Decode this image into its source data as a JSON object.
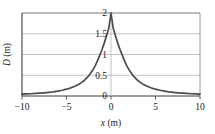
{
  "figure": {
    "name": "wave-pulse-plot"
  },
  "chart_data": {
    "type": "line",
    "title": "",
    "subtitle": "",
    "xlabel": "x (m)",
    "xlabel_symbol": "x",
    "xlabel_unit": "(m)",
    "ylabel": "D (m)",
    "ylabel_symbol": "D",
    "ylabel_unit": "(m)",
    "xlim": [
      -10,
      10
    ],
    "ylim": [
      0,
      2
    ],
    "xticks": [
      -10,
      -5,
      0,
      5,
      10
    ],
    "xticklabels": [
      "-10",
      "-5",
      "0",
      "5",
      "10"
    ],
    "yticks": [
      0,
      0.5,
      1,
      1.5,
      2
    ],
    "yticklabels": [
      "0",
      "0.5",
      "1",
      "1.5",
      "2"
    ],
    "grid": "horizontal",
    "legend": "none",
    "series": [
      {
        "name": "D(x)",
        "color": "#4c4c4c",
        "description": "Symmetric pulse peaking at 2 m at x = 0, falling toward 0 at the edges",
        "x": [
          -10,
          -9.5,
          -9,
          -8.5,
          -8,
          -7.5,
          -7,
          -6.5,
          -6,
          -5.5,
          -5,
          -4.5,
          -4,
          -3.5,
          -3,
          -2.5,
          -2,
          -1.75,
          -1.5,
          -1.25,
          -1,
          -0.75,
          -0.5,
          -0.25,
          0,
          0.25,
          0.5,
          0.75,
          1,
          1.25,
          1.5,
          1.75,
          2,
          2.5,
          3,
          3.5,
          4,
          4.5,
          5,
          5.5,
          6,
          6.5,
          7,
          7.5,
          8,
          8.5,
          9,
          9.5,
          10
        ],
        "y": [
          0.044,
          0.049,
          0.054,
          0.061,
          0.068,
          0.077,
          0.088,
          0.101,
          0.118,
          0.138,
          0.164,
          0.197,
          0.24,
          0.298,
          0.375,
          0.486,
          0.64,
          0.74,
          0.857,
          0.99,
          1.125,
          1.28,
          1.45,
          1.63,
          2.0,
          1.63,
          1.45,
          1.28,
          1.125,
          0.99,
          0.857,
          0.74,
          0.64,
          0.486,
          0.375,
          0.298,
          0.24,
          0.197,
          0.164,
          0.138,
          0.118,
          0.101,
          0.088,
          0.077,
          0.068,
          0.061,
          0.054,
          0.049,
          0.044
        ]
      }
    ]
  },
  "colors": {
    "curve": "#4c4c4c",
    "axis": "#3a3a3a",
    "grid": "#b4b4b4",
    "frame": "#8d8d8d",
    "text": "#222222",
    "background": "#ffffff"
  }
}
